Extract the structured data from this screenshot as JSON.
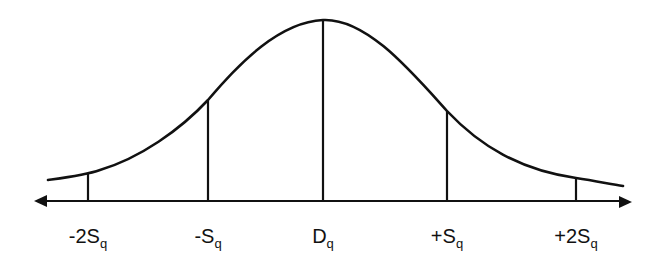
{
  "diagram": {
    "type": "normal-distribution-curve",
    "stroke_color": "#111111",
    "background": "#ffffff",
    "axis": {
      "direction": "bidirectional",
      "arrows": [
        "left",
        "right"
      ]
    },
    "markers": [
      {
        "label_main": "-2S",
        "label_sub": "q",
        "position": "mean - 2 std"
      },
      {
        "label_main": "-S",
        "label_sub": "q",
        "position": "mean - 1 std"
      },
      {
        "label_main": "D",
        "label_sub": "q",
        "position": "mean"
      },
      {
        "label_main": "+S",
        "label_sub": "q",
        "position": "mean + 1 std"
      },
      {
        "label_main": "+2S",
        "label_sub": "q",
        "position": "mean + 2 std"
      }
    ]
  }
}
